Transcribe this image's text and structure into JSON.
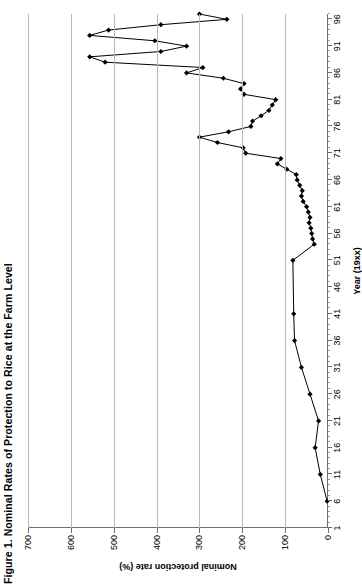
{
  "title": "Figure 1. Nominal Rates of Protection to Rice at the Farm Level",
  "axis": {
    "ylabel": "Nominal protection rate (%)",
    "xlabel": "Year (19xx)",
    "yticks": [
      "0",
      "100",
      "200",
      "300",
      "400",
      "500",
      "600",
      "700"
    ],
    "xticks": [
      "1",
      "6",
      "11",
      "16",
      "21",
      "26",
      "31",
      "36",
      "41",
      "46",
      "51",
      "56",
      "61",
      "66",
      "71",
      "76",
      "81",
      "86",
      "91",
      "96"
    ]
  },
  "style": {
    "line_color": "#000000",
    "grid_color": "#b9b9b9",
    "axis_color": "#6e6e6e",
    "background": "#ffffff"
  },
  "chart_data": {
    "type": "line",
    "title": "Figure 1. Nominal Rates of Protection to Rice at the Farm Level",
    "xlabel": "Year (19xx)",
    "ylabel": "Nominal protection rate (%)",
    "xlim": [
      1,
      97
    ],
    "ylim": [
      0,
      700
    ],
    "ytick_values": [
      0,
      100,
      200,
      300,
      400,
      500,
      600,
      700
    ],
    "xtick_values": [
      1,
      6,
      11,
      16,
      21,
      26,
      31,
      36,
      41,
      46,
      51,
      56,
      61,
      66,
      71,
      76,
      81,
      86,
      91,
      96
    ],
    "grid": "horizontal-only-on-value-axis",
    "legend": "none",
    "markers": "filled diamond",
    "series": [
      {
        "name": "Nominal protection rate",
        "x": [
          6,
          11,
          16,
          21,
          26,
          31,
          36,
          41,
          51,
          54,
          55,
          56,
          57,
          58,
          59,
          60,
          61,
          62,
          63,
          64,
          65,
          66,
          67,
          68,
          69,
          70,
          71,
          72,
          73,
          74,
          75,
          76,
          77,
          78,
          79,
          80,
          81,
          82,
          83,
          84,
          85,
          86,
          87,
          88,
          89,
          90,
          91,
          92,
          93,
          94,
          95,
          96,
          97
        ],
        "y": [
          2,
          18,
          30,
          22,
          42,
          62,
          78,
          80,
          82,
          32,
          36,
          38,
          40,
          44,
          42,
          46,
          50,
          58,
          62,
          60,
          66,
          72,
          74,
          96,
          118,
          110,
          192,
          198,
          258,
          300,
          232,
          180,
          176,
          156,
          138,
          130,
          122,
          196,
          204,
          196,
          244,
          330,
          292,
          520,
          556,
          390,
          330,
          404,
          556,
          512,
          390,
          236,
          300
        ]
      }
    ]
  }
}
